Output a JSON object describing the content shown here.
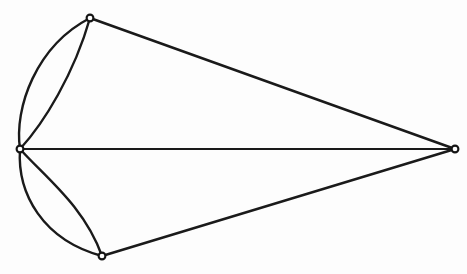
{
  "figure": {
    "kind": "graph-diagram",
    "width": 467,
    "height": 274,
    "background_color": "#fdfdfd",
    "stroke_color": "#1a1a1a",
    "vertex_fill_color": "#ffffff",
    "vertex_stroke_color": "#141414",
    "vertex_radius": 3.4,
    "vertex_count": 4,
    "edge_count": 7,
    "face_count": 5
  },
  "vertices": [
    {
      "id": "v-left",
      "label": "left-vertex",
      "x": 20,
      "y": 149,
      "degree": 5
    },
    {
      "id": "v-top",
      "label": "top-vertex",
      "x": 90,
      "y": 18,
      "degree": 3
    },
    {
      "id": "v-bottom",
      "label": "bottom-vertex",
      "x": 102,
      "y": 256,
      "degree": 3
    },
    {
      "id": "v-right",
      "label": "right-vertex",
      "x": 455,
      "y": 149,
      "degree": 3
    }
  ],
  "edges": [
    {
      "id": "e-left-top-outer",
      "from": "v-left",
      "to": "v-top",
      "shape": "curved",
      "bulge": "outward-left",
      "stroke_width": 2.4,
      "path": "M 20 149 C 14 108 36 46 90 18"
    },
    {
      "id": "e-left-top-inner",
      "from": "v-left",
      "to": "v-top",
      "shape": "curved",
      "bulge": "inward-right",
      "stroke_width": 2.4,
      "path": "M 20 149 C 44 123 74 74 90 18"
    },
    {
      "id": "e-left-bottom-outer",
      "from": "v-left",
      "to": "v-bottom",
      "shape": "curved",
      "bulge": "outward-left",
      "stroke_width": 2.4,
      "path": "M 20 149 C 17 194 43 240 102 256"
    },
    {
      "id": "e-left-bottom-inner",
      "from": "v-left",
      "to": "v-bottom",
      "shape": "curved",
      "bulge": "inward-right",
      "stroke_width": 2.4,
      "path": "M 20 149 C 46 178 84 206 102 256"
    },
    {
      "id": "e-top-right",
      "from": "v-top",
      "to": "v-right",
      "shape": "straight",
      "stroke_width": 2.5,
      "path": "M 90 18 L 455 149"
    },
    {
      "id": "e-left-right",
      "from": "v-left",
      "to": "v-right",
      "shape": "straight",
      "orientation": "horizontal",
      "stroke_width": 2.2,
      "path": "M 20 149 L 455 149"
    },
    {
      "id": "e-bottom-right",
      "from": "v-bottom",
      "to": "v-right",
      "shape": "straight",
      "stroke_width": 2.5,
      "path": "M 102 256 L 455 149"
    }
  ]
}
